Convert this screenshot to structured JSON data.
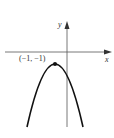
{
  "diagram": {
    "type": "parabola-graph",
    "axes": {
      "x_label": "x",
      "y_label": "y"
    },
    "vertex": {
      "label": "(−1, −1)",
      "x": -1,
      "y": -1
    },
    "curve": {
      "opens": "down",
      "color": "#111111"
    },
    "colors": {
      "axis": "#555555",
      "curve": "#111111",
      "background": "#ffffff"
    }
  }
}
